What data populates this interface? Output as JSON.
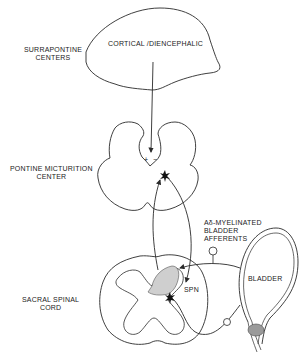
{
  "diagram": {
    "labels": {
      "surrapontine_line1": "SURRAPONTINE",
      "surrapontine_line2": "CENTERS",
      "cortical": "CORTICAL /DIENCEPHALIC",
      "pontine_line1": "PONTINE  MICTURITION",
      "pontine_line2": "CENTER",
      "afferents_line1": "Aδ-MYELINATED",
      "afferents_line2": "BLADDER",
      "afferents_line3": "AFFERENTS",
      "bladder": "BLADDER",
      "sacral_line1": "SACRAL  SPINAL",
      "sacral_line2": "CORD",
      "spn": "SPN",
      "plus": "+",
      "minus": "−"
    },
    "colors": {
      "line": "#2a2a2a",
      "shade": "#bdbdbd",
      "background": "#ffffff"
    }
  }
}
